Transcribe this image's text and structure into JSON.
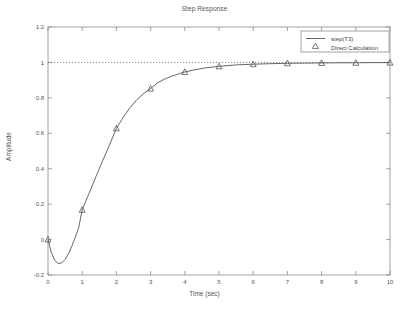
{
  "chart_data": {
    "type": "line",
    "title": "Step Response",
    "xlabel": "Time (sec)",
    "ylabel": "Amplitude",
    "xlim": [
      0,
      10
    ],
    "ylim": [
      -0.2,
      1.2
    ],
    "xticks": [
      "0",
      "1",
      "2",
      "3",
      "4",
      "5",
      "6",
      "7",
      "8",
      "9",
      "10"
    ],
    "yticks": [
      "-0.2",
      "0",
      "0.2",
      "0.4",
      "0.6",
      "0.8",
      "1",
      "1.2"
    ],
    "xtick_values": [
      0,
      1,
      2,
      3,
      4,
      5,
      6,
      7,
      8,
      9,
      10
    ],
    "ytick_values": [
      -0.2,
      0,
      0.2,
      0.4,
      0.6,
      0.8,
      1,
      1.2
    ],
    "grid": false,
    "legend_position": "top-right",
    "reference_line": {
      "y": 1,
      "style": "dotted",
      "color": "#555555"
    },
    "series": [
      {
        "name": "step(T3)",
        "marker": "line",
        "color": "#555555",
        "x": [
          0,
          0.1,
          0.2,
          0.3,
          0.4,
          0.5,
          0.6,
          0.7,
          0.8,
          0.9,
          1,
          1.2,
          1.4,
          1.6,
          1.8,
          2,
          2.2,
          2.4,
          2.6,
          2.8,
          3,
          3.2,
          3.4,
          3.6,
          3.8,
          4,
          4.3,
          4.6,
          5,
          5.5,
          6,
          6.5,
          7,
          7.5,
          8,
          8.5,
          9,
          9.5,
          10
        ],
        "y": [
          0,
          -0.075,
          -0.118,
          -0.135,
          -0.132,
          -0.112,
          -0.079,
          -0.036,
          0.014,
          0.069,
          0.168,
          0.26,
          0.355,
          0.446,
          0.535,
          0.628,
          0.69,
          0.745,
          0.79,
          0.825,
          0.852,
          0.884,
          0.905,
          0.921,
          0.934,
          0.946,
          0.959,
          0.969,
          0.978,
          0.986,
          0.99,
          0.993,
          0.995,
          0.996,
          0.997,
          0.998,
          0.998,
          0.999,
          0.999
        ]
      },
      {
        "name": "Direct Calculation",
        "marker": "triangle",
        "color": "#555555",
        "x": [
          0,
          1,
          2,
          3,
          4,
          5,
          6,
          7,
          8,
          9,
          10
        ],
        "y": [
          0,
          0.168,
          0.628,
          0.852,
          0.946,
          0.978,
          0.99,
          0.995,
          0.997,
          0.998,
          0.999
        ]
      }
    ]
  },
  "legend": {
    "entries": [
      {
        "label": "step(T3)",
        "marker": "line"
      },
      {
        "label": "Direct Calculation",
        "marker": "triangle"
      }
    ]
  }
}
